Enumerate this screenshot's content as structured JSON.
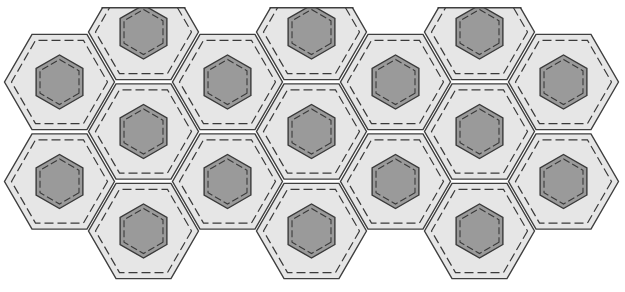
{
  "diagram": {
    "width": 625,
    "height": 292,
    "colors": {
      "background": "#ffffff",
      "outer_fill": "#e6e6e6",
      "outer_stroke": "#3f3f3f",
      "inner_fill": "#9a9a9a",
      "inner_stroke": "#3a3a3a",
      "dash_stroke": "#3a3a3a"
    },
    "geometry": {
      "column_start_x": 59.5,
      "column_step_x": 84,
      "outer_radius": 55,
      "outer_dash_radius": 48,
      "inner_radius": 27,
      "inner_dash_radius": 22.5,
      "clip_top_y": 7
    },
    "columns": [
      {
        "index": 0,
        "rows_y": [
          82,
          181.5
        ]
      },
      {
        "index": 1,
        "rows_y": [
          32,
          131.5,
          231
        ]
      },
      {
        "index": 2,
        "rows_y": [
          82,
          181.5
        ]
      },
      {
        "index": 3,
        "rows_y": [
          32,
          131.5,
          231
        ]
      },
      {
        "index": 4,
        "rows_y": [
          82,
          181.5
        ]
      },
      {
        "index": 5,
        "rows_y": [
          32,
          131.5,
          231
        ]
      },
      {
        "index": 6,
        "rows_y": [
          82,
          181.5
        ]
      }
    ],
    "tile_counts": {
      "full": 17,
      "partial_top": 3
    }
  }
}
